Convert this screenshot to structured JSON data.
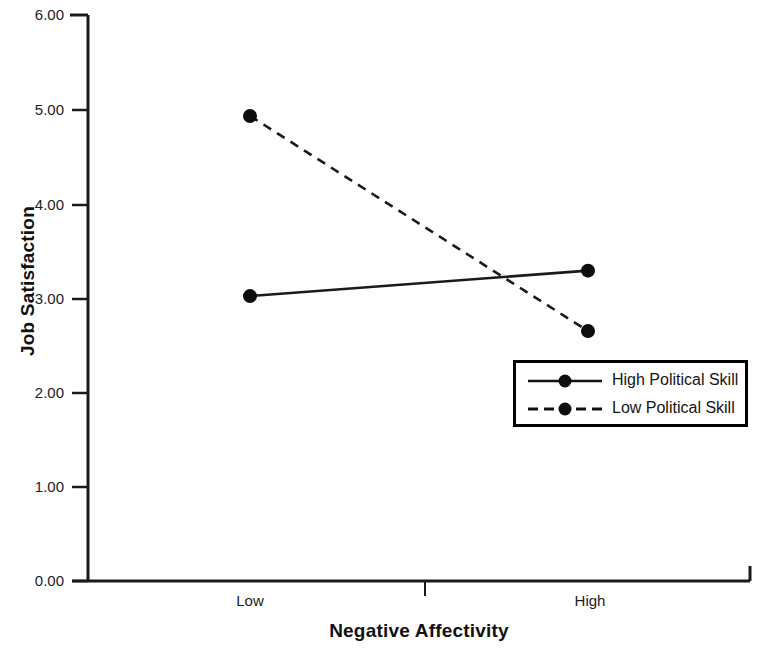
{
  "chart_data": {
    "type": "line",
    "title": "",
    "subtitle": "",
    "xlabel": "Negative Affectivity",
    "ylabel": "Job Satisfaction",
    "categories": [
      "Low",
      "High"
    ],
    "x_tick_labels": [
      "Low",
      "High"
    ],
    "y_tick_labels": [
      "0.00",
      "1.00",
      "2.00",
      "3.00",
      "4.00",
      "5.00",
      "6.00"
    ],
    "y_ticks": [
      0,
      1,
      2,
      3,
      4,
      5,
      6
    ],
    "ylim": [
      0,
      6
    ],
    "xlim": [
      0,
      1
    ],
    "grid": false,
    "legend_position": "center-right-inside",
    "series": [
      {
        "name": "High Political Skill",
        "linestyle": "solid",
        "marker": "circle",
        "color": "#000000",
        "values": [
          3.02,
          3.29
        ]
      },
      {
        "name": "Low Political Skill",
        "linestyle": "dashed",
        "marker": "circle",
        "color": "#000000",
        "values": [
          4.93,
          2.65
        ]
      }
    ],
    "annotations": []
  },
  "legend": {
    "items": [
      {
        "label": "High Political Skill",
        "style": "solid"
      },
      {
        "label": "Low Political Skill",
        "style": "dashed"
      }
    ]
  },
  "axes": {
    "y_label": "Job Satisfaction",
    "x_label": "Negative Affectivity",
    "y_tick_0": "0.00",
    "y_tick_1": "1.00",
    "y_tick_2": "2.00",
    "y_tick_3": "3.00",
    "y_tick_4": "4.00",
    "y_tick_5": "5.00",
    "y_tick_6": "6.00",
    "x_tick_low": "Low",
    "x_tick_high": "High"
  },
  "colors": {
    "line": "#000000",
    "axis": "#1a1a1a",
    "background": "#ffffff",
    "text": "#111111"
  }
}
